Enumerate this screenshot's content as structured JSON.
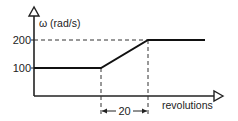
{
  "diagram": {
    "y_axis_label": "ω (rad/s)",
    "x_axis_label": "revolutions",
    "y_ticks": [
      {
        "label": "200",
        "value": 200
      },
      {
        "label": "100",
        "value": 100
      }
    ],
    "dimension_label": "20",
    "profile": [
      {
        "rev": 0,
        "omega": 100
      },
      {
        "rev": "r1",
        "omega": 100
      },
      {
        "rev": "r1+20",
        "omega": 200
      },
      {
        "rev": "end",
        "omega": 200
      }
    ]
  }
}
